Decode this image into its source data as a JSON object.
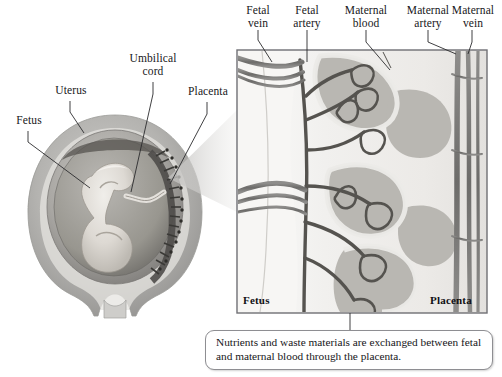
{
  "figure": {
    "background_color": "#ffffff",
    "text_color": "#17171a"
  },
  "left_diagram": {
    "name": "fetus-in-uterus-illustration",
    "labels": [
      {
        "id": "uterus",
        "text": "Uterus",
        "x": 48,
        "y": 88,
        "width": 46
      },
      {
        "id": "fetus",
        "text": "Fetus",
        "x": 8,
        "y": 118,
        "width": 42
      },
      {
        "id": "umbilical-cord",
        "text": "Umbilical\ncord",
        "x": 126,
        "y": 56,
        "width": 62
      },
      {
        "id": "placenta",
        "text": "Placenta",
        "x": 181,
        "y": 89,
        "width": 56
      }
    ],
    "leader_lines": [
      {
        "id": "uterus-leader",
        "x1": 70,
        "y1": 101,
        "x2": 82,
        "y2": 135
      },
      {
        "id": "fetus-leader",
        "x1": 28,
        "y1": 131,
        "x2": 88,
        "y2": 188
      },
      {
        "id": "umbilical-cord-leader",
        "x1": 153,
        "y1": 82,
        "x2": 130,
        "y2": 190
      },
      {
        "id": "placenta-leader",
        "x1": 207,
        "y1": 102,
        "x2": 170,
        "y2": 182
      }
    ]
  },
  "magnified_panel": {
    "name": "placenta-cross-section-panel",
    "bounds": {
      "x": 237,
      "y": 50,
      "width": 250,
      "height": 263
    },
    "border_color": "#6f6f74",
    "fill_color": "#f2f1ef",
    "top_labels": [
      {
        "id": "fetal-vein",
        "text": "Fetal\nvein",
        "x": 234,
        "y": 4,
        "width": 48,
        "tip_x": 272,
        "tip_y": 62
      },
      {
        "id": "fetal-artery",
        "text": "Fetal\nartery",
        "x": 283,
        "y": 4,
        "width": 52,
        "tip_x": 307,
        "tip_y": 62
      },
      {
        "id": "maternal-blood",
        "text": "Maternal\nblood",
        "x": 338,
        "y": 4,
        "width": 62,
        "tip_x": 383,
        "tip_y": 68
      },
      {
        "id": "maternal-artery",
        "text": "Maternal\nartery",
        "x": 400,
        "y": 4,
        "width": 62,
        "tip_x": 455,
        "tip_y": 58
      },
      {
        "id": "maternal-vein",
        "text": "Maternal\nvein",
        "x": 448,
        "y": 4,
        "width": 54,
        "tip_x": 470,
        "tip_y": 54
      }
    ],
    "inner_tags": [
      {
        "id": "panel-tag-fetus",
        "text": "Fetus",
        "x": 243,
        "y": 296
      },
      {
        "id": "panel-tag-placenta",
        "text": "Placenta",
        "x": 432,
        "y": 296
      }
    ]
  },
  "caption": {
    "name": "exchange-caption",
    "text": "Nutrients and waste materials are exchanged between fetal and maternal blood through the placenta.",
    "connector": {
      "x": 350,
      "y1": 313,
      "y2": 330
    }
  }
}
